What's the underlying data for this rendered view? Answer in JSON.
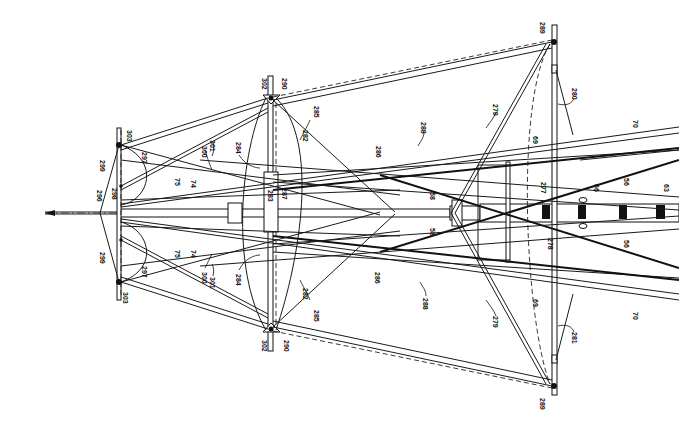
{
  "figure": {
    "background": "#ffffff",
    "ink": "#111111"
  },
  "labels": {
    "l303a": "303",
    "l303b": "303",
    "l299a": "299",
    "l299b": "299",
    "l297a": "297",
    "l297b": "297",
    "l296": "296",
    "l298": "298",
    "l300a": "300",
    "l300b": "300",
    "l301a": "301",
    "l301b": "301",
    "l75a": "75",
    "l75b": "75",
    "l74a": "74",
    "l74b": "74",
    "l302a": "302",
    "l302b": "302",
    "l290a": "290",
    "l290b": "290",
    "l285a": "285",
    "l285b": "285",
    "l282a": "282",
    "l282b": "282",
    "l284a": "284",
    "l284b": "284",
    "l286a": "286",
    "l286b": "286",
    "l283": "283",
    "l287": "287",
    "l288a": "288",
    "l288b": "288",
    "l279a": "279",
    "l279b": "279",
    "l289a": "289",
    "l289b": "289",
    "l280": "280",
    "l281": "281",
    "l69a": "69",
    "l69b": "69",
    "l277": "277",
    "l278": "278",
    "l58a": "58",
    "l58b": "58",
    "l66": "66",
    "l56a": "56",
    "l56b": "56",
    "l63": "63",
    "l70a": "70",
    "l70b": "70"
  }
}
